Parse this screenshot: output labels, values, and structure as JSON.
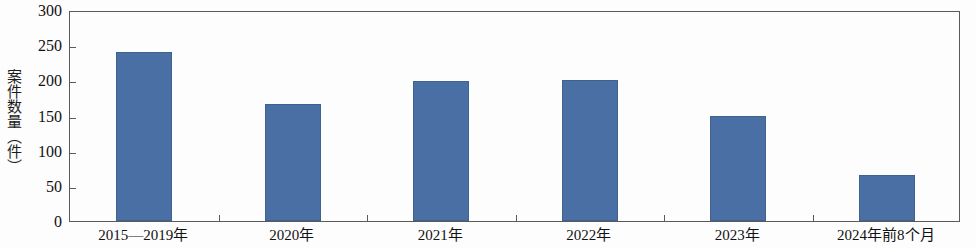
{
  "chart_data": {
    "type": "bar",
    "title": "",
    "xlabel": "",
    "ylabel": "案件数量（件）",
    "categories": [
      "2015—2019年",
      "2020年",
      "2021年",
      "2022年",
      "2023年",
      "2024年前8个月"
    ],
    "values": [
      240,
      166,
      199,
      200,
      149,
      65
    ],
    "ylim": [
      0,
      300
    ],
    "ytick_labels": [
      "0",
      "50",
      "100",
      "150",
      "200",
      "250",
      "300"
    ],
    "ytick_values": [
      0,
      50,
      100,
      150,
      200,
      250,
      300
    ],
    "grid": false,
    "legend": false,
    "series": [
      {
        "name": "案件数量",
        "values": [
          240,
          166,
          199,
          200,
          149,
          65
        ]
      }
    ],
    "colors": {
      "bar_fill": "#4a6fa5",
      "bar_edge": "#40628f",
      "axis": "#5a5a5a",
      "text": "#111111",
      "background": "#fdfdfd"
    }
  }
}
